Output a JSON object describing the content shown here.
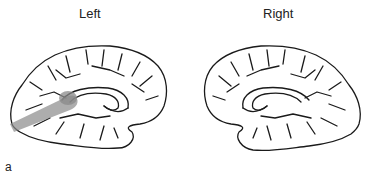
{
  "figure": {
    "panel_label": "a",
    "left": {
      "title": "Left",
      "highlight": "shaded tract from occipital pole toward splenium",
      "highlight_color": "#8a8a8a"
    },
    "right": {
      "title": "Right"
    },
    "outline_color": "#1a1a1a"
  }
}
